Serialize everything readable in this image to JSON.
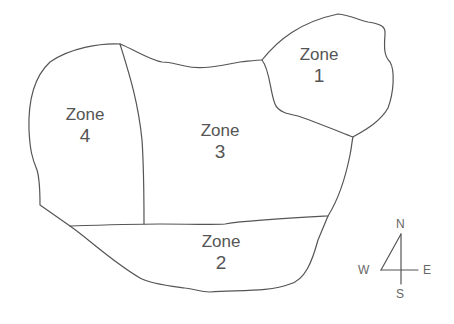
{
  "diagram": {
    "type": "zone map",
    "line_color": "#555555",
    "text_color": "#555555",
    "zones": [
      {
        "id": 1,
        "word": "Zone",
        "number": "1"
      },
      {
        "id": 2,
        "word": "Zone",
        "number": "2"
      },
      {
        "id": 3,
        "word": "Zone",
        "number": "3"
      },
      {
        "id": 4,
        "word": "Zone",
        "number": "4"
      }
    ],
    "compass": {
      "north": "N",
      "south": "S",
      "east": "E",
      "west": "W"
    }
  }
}
